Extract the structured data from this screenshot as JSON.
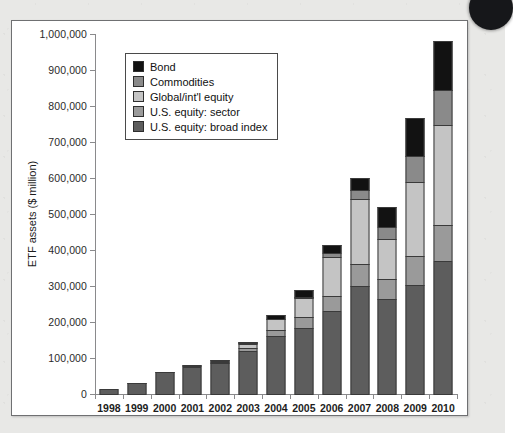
{
  "figure": {
    "axis_title_y": "ETF assets ($ million)",
    "legend_title": ""
  },
  "chart_data": {
    "type": "bar",
    "stacked": true,
    "title": "",
    "xlabel": "",
    "ylabel": "ETF assets ($ million)",
    "ylim": [
      0,
      1000000
    ],
    "ytick_values": [
      0,
      100000,
      200000,
      300000,
      400000,
      500000,
      600000,
      700000,
      800000,
      900000,
      1000000
    ],
    "ytick_labels": [
      "0",
      "100,000",
      "200,000",
      "300,000",
      "400,000",
      "500,000",
      "600,000",
      "700,000",
      "800,000",
      "900,000",
      "1,000,000"
    ],
    "grid": false,
    "legend_position": "upper-left-inside",
    "categories": [
      "1998",
      "1999",
      "2000",
      "2001",
      "2002",
      "2003",
      "2004",
      "2005",
      "2006",
      "2007",
      "2008",
      "2009",
      "2010"
    ],
    "series": [
      {
        "name": "U.S. equity: broad index",
        "color": "#5d5d5d",
        "values": [
          15000,
          32000,
          63000,
          78000,
          87000,
          122000,
          163000,
          185000,
          233000,
          301000,
          265000,
          304000,
          372000
        ]
      },
      {
        "name": "U.S. equity: sector",
        "color": "#9a9a9a",
        "values": [
          0,
          1000,
          2000,
          4000,
          6000,
          10000,
          17000,
          31000,
          43000,
          63000,
          58000,
          83000,
          101000
        ]
      },
      {
        "name": "Global/int'l equity",
        "color": "#c4c4c4",
        "values": [
          0,
          0,
          0,
          1000,
          5000,
          13000,
          32000,
          55000,
          110000,
          182000,
          112000,
          208000,
          280000
        ]
      },
      {
        "name": "Commodities",
        "color": "#8a8a8a",
        "values": [
          0,
          0,
          0,
          0,
          0,
          1000,
          2000,
          5000,
          13000,
          26000,
          36000,
          72000,
          97000
        ]
      },
      {
        "name": "Bond",
        "color": "#121212",
        "values": [
          0,
          0,
          0,
          0,
          3000,
          5000,
          13000,
          22000,
          23000,
          37000,
          58000,
          108000,
          140000
        ]
      }
    ],
    "totals": [
      15000,
      33000,
      65000,
      83000,
      101000,
      151000,
      227000,
      298000,
      422000,
      609000,
      529000,
      775000,
      990000
    ],
    "legend_entries": [
      {
        "label": "Bond",
        "color": "#121212"
      },
      {
        "label": "Commodities",
        "color": "#8a8a8a"
      },
      {
        "label": "Global/int'l equity",
        "color": "#c4c4c4"
      },
      {
        "label": "U.S. equity: sector",
        "color": "#9a9a9a"
      },
      {
        "label": "U.S. equity: broad index",
        "color": "#5d5d5d"
      }
    ]
  }
}
